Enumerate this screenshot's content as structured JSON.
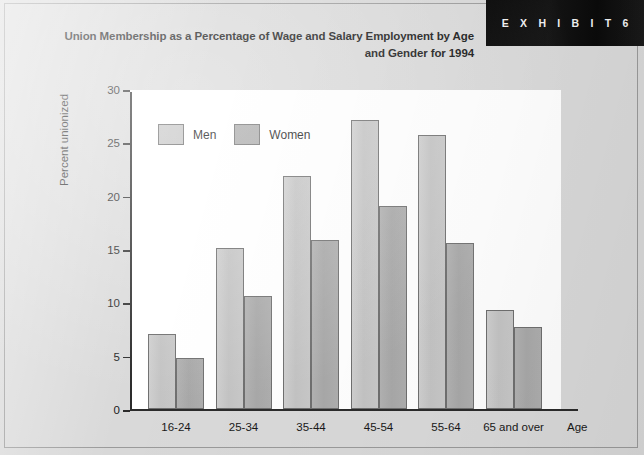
{
  "exhibit": {
    "label": "E X H I B I T   6"
  },
  "title": {
    "line1": "Union Membership as a Percentage of Wage and Salary Employment by Age",
    "line2": "and Gender for 1994"
  },
  "axis": {
    "y_title": "Percent unionized",
    "x_title": "Age",
    "y_ticks": [
      "0",
      "5",
      "10",
      "15",
      "20",
      "25",
      "30"
    ]
  },
  "legend": {
    "items": [
      {
        "label": "Men",
        "color": "#c6c6c6"
      },
      {
        "label": "Women",
        "color": "#ababab"
      }
    ]
  },
  "colors": {
    "page_background": "#d8d8d8",
    "plot_background": "#ffffff",
    "men_bar": "#c6c6c6",
    "women_bar": "#ababab",
    "bar_border": "#6f6f6f",
    "axis": "#2b2b2b",
    "exhibit_box": "#0b0b0b",
    "text": "#141414"
  },
  "chart_data": {
    "type": "bar",
    "title": "Union Membership as a Percentage of Wage and Salary Employment by Age and Gender for 1994",
    "xlabel": "Age",
    "ylabel": "Percent unionized",
    "ylim": [
      0,
      30
    ],
    "ytick_step": 5,
    "grid": false,
    "legend_position": "upper-left-inside",
    "categories": [
      "16-24",
      "25-34",
      "35-44",
      "45-54",
      "55-64",
      "65 and over"
    ],
    "series": [
      {
        "name": "Men",
        "color": "#c6c6c6",
        "values": [
          7.0,
          15.1,
          21.8,
          27.1,
          25.7,
          9.3
        ]
      },
      {
        "name": "Women",
        "color": "#ababab",
        "values": [
          4.8,
          10.6,
          15.8,
          19.0,
          15.6,
          7.7
        ]
      }
    ]
  }
}
